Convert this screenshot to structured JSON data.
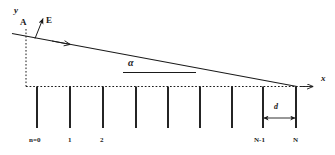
{
  "figure": {
    "type": "diagram",
    "stroke_color": "#1a1a1a",
    "background_color": "#ffffff"
  },
  "axes": {
    "y_label": "y",
    "x_label": "x",
    "y_axis_style": "dashed",
    "x_axis_style": "dashed"
  },
  "points": {
    "origin_label": "A",
    "field_vector_label": "E"
  },
  "angle": {
    "label": "α"
  },
  "spacing": {
    "label": "d"
  },
  "grating": {
    "line_count": 9,
    "tick_labels": [
      {
        "text": "n=0",
        "index": 0
      },
      {
        "text": "1",
        "index": 1
      },
      {
        "text": "2",
        "index": 2
      },
      {
        "text": "N-1",
        "index": 7
      },
      {
        "text": "N",
        "index": 8
      }
    ]
  }
}
